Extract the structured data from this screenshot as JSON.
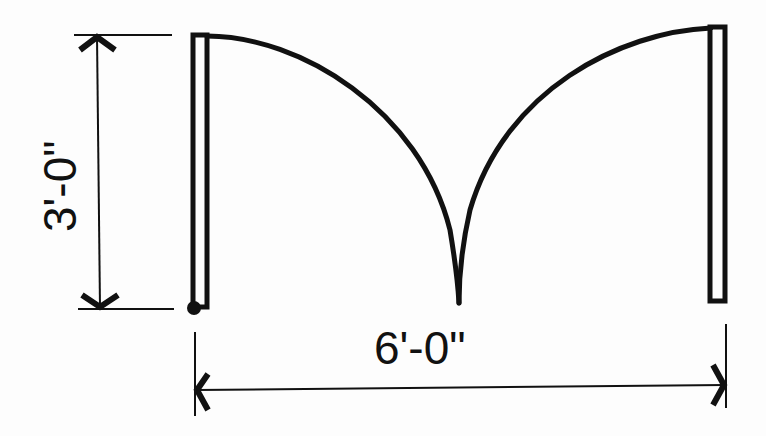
{
  "diagram": {
    "type": "double-door floor plan symbol",
    "colors": {
      "stroke": "#111111",
      "background": "#fdfdfd"
    },
    "dimensions": {
      "door_leaf_width": "3'-0\"",
      "opening_width": "6'-0\""
    },
    "elements": [
      {
        "id": "left-door-leaf",
        "label": "left door leaf (hinged at bottom-left)"
      },
      {
        "id": "right-door-leaf",
        "label": "right door leaf"
      },
      {
        "id": "left-swing-arc",
        "label": "left door swing arc"
      },
      {
        "id": "right-swing-arc",
        "label": "right door swing arc"
      },
      {
        "id": "hinge-point",
        "label": "hinge point"
      },
      {
        "id": "vertical-dimension",
        "label": "3'-0\""
      },
      {
        "id": "horizontal-dimension",
        "label": "6'-0\""
      }
    ]
  }
}
